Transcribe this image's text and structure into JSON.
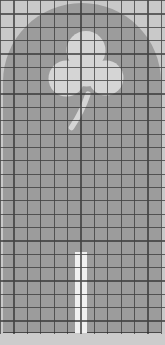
{
  "canvas": {
    "width_px": 165,
    "height_px": 345,
    "background_color": "#c9c9c9"
  },
  "grid": {
    "columns": 12,
    "rows": 25,
    "cell_size_px": 13.4,
    "line_color": "rgba(48,48,48,0.85)"
  },
  "shapes": {
    "arch": {
      "name": "arched-window-panel",
      "color": "#9c9c9c"
    },
    "clover": {
      "name": "clover-cutout",
      "color": "#d5d5d5"
    },
    "stripe": {
      "name": "vertical-stripe",
      "color": "#f0f0f0"
    },
    "margin": {
      "name": "bottom-margin",
      "color": "#cccccc"
    }
  }
}
